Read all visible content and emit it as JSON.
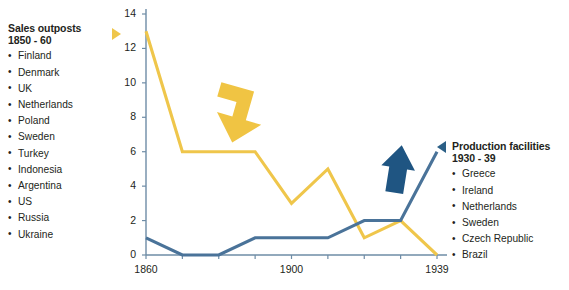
{
  "legend_left": {
    "title": "Sales outposts",
    "subtitle": "1850 - 60",
    "marker_icon": "triangle-right-icon",
    "items": [
      "Finland",
      "Denmark",
      "UK",
      "Netherlands",
      "Poland",
      "Sweden",
      "Turkey",
      "Indonesia",
      "Argentina",
      "US",
      "Russia",
      "Ukraine"
    ]
  },
  "legend_right": {
    "title": "Production facilities",
    "subtitle": "1930 - 39",
    "marker_icon": "triangle-left-icon",
    "items": [
      "Greece",
      "Ireland",
      "Netherlands",
      "Sweden",
      "Czech Republic",
      "Brazil"
    ]
  },
  "colors": {
    "sales_line": "#efc64b",
    "sales_arrow": "#f0c443",
    "production_line": "#4a7399",
    "production_arrow": "#1f5582",
    "axis": "#6e8ca6",
    "text": "#231f20"
  },
  "annotations": [
    {
      "name": "down-arrow-sales",
      "icon": "arrow-down-right-icon",
      "color": "#f0c443"
    },
    {
      "name": "up-arrow-production",
      "icon": "arrow-up-icon",
      "color": "#1f5582"
    }
  ],
  "chart_data": {
    "type": "line",
    "title": "",
    "xlabel": "",
    "ylabel": "",
    "ylim": [
      0,
      14
    ],
    "xlim": [
      1860,
      1939
    ],
    "grid": false,
    "legend_position": "outside-left-and-right",
    "ytick_labels": [
      "0",
      "2",
      "4",
      "6",
      "8",
      "10",
      "12",
      "14"
    ],
    "yticks": [
      0,
      2,
      4,
      6,
      8,
      10,
      12,
      14
    ],
    "xtick_labels": [
      "1860",
      "1900",
      "1939"
    ],
    "xticks": [
      1860,
      1900,
      1939
    ],
    "x": [
      1860,
      1870,
      1880,
      1890,
      1900,
      1910,
      1920,
      1930,
      1939
    ],
    "series": [
      {
        "name": "Sales outposts",
        "color": "#efc64b",
        "values": [
          13,
          6,
          6,
          6,
          3,
          5,
          1,
          2,
          0
        ]
      },
      {
        "name": "Production facilities",
        "color": "#4a7399",
        "values": [
          1,
          0,
          0,
          1,
          1,
          1,
          2,
          2,
          6
        ]
      }
    ]
  }
}
